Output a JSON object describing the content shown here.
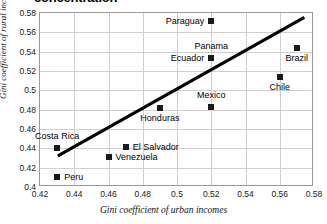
{
  "chart_data": {
    "type": "scatter",
    "title": "concentration",
    "xlabel": "Gini coefficient of urban incomes",
    "ylabel": "Gini coefficient of rural incomes",
    "xlim": [
      0.42,
      0.58
    ],
    "ylim": [
      0.4,
      0.58
    ],
    "xticks": [
      "0.42",
      "0.44",
      "0.46",
      "0.48",
      "0.5",
      "0.52",
      "0.54",
      "0.56",
      "0.58"
    ],
    "yticks": [
      "0.4",
      "0.42",
      "0.44",
      "0.46",
      "0.48",
      "0.5",
      "0.52",
      "0.54",
      "0.56",
      "0.58"
    ],
    "grid": true,
    "legend": "none",
    "marker_color": "#1a1a1a",
    "trendline_color": "#000000",
    "gridline_color": "#cfcfcf",
    "border_color": "#9a9a9a",
    "points": [
      {
        "label": "Paraguay",
        "x": 0.52,
        "y": 0.572,
        "label_pos": "left"
      },
      {
        "label": "Panama",
        "x": 0.52,
        "y": 0.533,
        "label_pos": "above"
      },
      {
        "label": "Ecuador",
        "x": 0.52,
        "y": 0.533,
        "label_pos": "left"
      },
      {
        "label": "Brazil",
        "x": 0.57,
        "y": 0.544,
        "label_pos": "below"
      },
      {
        "label": "Chile",
        "x": 0.56,
        "y": 0.514,
        "label_pos": "below"
      },
      {
        "label": "Mexico",
        "x": 0.52,
        "y": 0.4825,
        "label_pos": "above"
      },
      {
        "label": "Honduras",
        "x": 0.49,
        "y": 0.482,
        "label_pos": "below"
      },
      {
        "label": "El Salvador",
        "x": 0.47,
        "y": 0.441,
        "label_pos": "right"
      },
      {
        "label": "Costa Rica",
        "x": 0.43,
        "y": 0.4405,
        "label_pos": "above"
      },
      {
        "label": "Venezuela",
        "x": 0.46,
        "y": 0.4315,
        "label_pos": "right"
      },
      {
        "label": "Peru",
        "x": 0.43,
        "y": 0.4105,
        "label_pos": "right"
      }
    ],
    "trendline": {
      "x1": 0.4305,
      "y1": 0.4305,
      "x2": 0.5755,
      "y2": 0.5755
    }
  }
}
